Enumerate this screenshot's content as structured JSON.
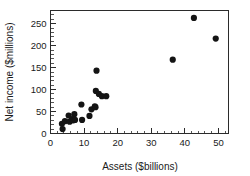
{
  "chart_data": {
    "type": "scatter",
    "title": "",
    "subtitle": "",
    "xlabel": "Assets ($billions)",
    "ylabel": "Net income ($millions)",
    "xlim": [
      0,
      53
    ],
    "ylim": [
      0,
      280
    ],
    "x_ticks": [
      0,
      10,
      20,
      30,
      40,
      50
    ],
    "x_tick_labels": [
      "0",
      "10",
      "20",
      "30",
      "40",
      "50"
    ],
    "x_minor_tick_step": 2,
    "y_ticks": [
      0,
      50,
      100,
      150,
      200,
      250
    ],
    "y_tick_labels": [
      "0",
      "50",
      "100",
      "150",
      "200",
      "250"
    ],
    "y_minor_tick_step": 10,
    "grid": false,
    "legend": null,
    "marker": "filled-circle",
    "marker_color": "#141414",
    "marker_size_px": 3.1,
    "frame": true,
    "points": [
      {
        "x": 3.4,
        "y": 22
      },
      {
        "x": 3.6,
        "y": 10
      },
      {
        "x": 4.3,
        "y": 28
      },
      {
        "x": 5.4,
        "y": 41
      },
      {
        "x": 5.7,
        "y": 27
      },
      {
        "x": 6.4,
        "y": 33
      },
      {
        "x": 6.8,
        "y": 30
      },
      {
        "x": 7.1,
        "y": 44
      },
      {
        "x": 7.3,
        "y": 31
      },
      {
        "x": 9.2,
        "y": 66
      },
      {
        "x": 9.4,
        "y": 31
      },
      {
        "x": 11.6,
        "y": 40
      },
      {
        "x": 12.2,
        "y": 55
      },
      {
        "x": 13.2,
        "y": 62
      },
      {
        "x": 13.4,
        "y": 60
      },
      {
        "x": 13.5,
        "y": 97
      },
      {
        "x": 13.7,
        "y": 143
      },
      {
        "x": 14.4,
        "y": 90
      },
      {
        "x": 15.3,
        "y": 85
      },
      {
        "x": 16.6,
        "y": 85
      },
      {
        "x": 36.4,
        "y": 168
      },
      {
        "x": 42.7,
        "y": 263
      },
      {
        "x": 49.2,
        "y": 216
      }
    ]
  },
  "figure": {
    "background_color": "#ffffff",
    "axis_color": "#2b2b2b",
    "text_color": "#1a1a1a"
  }
}
